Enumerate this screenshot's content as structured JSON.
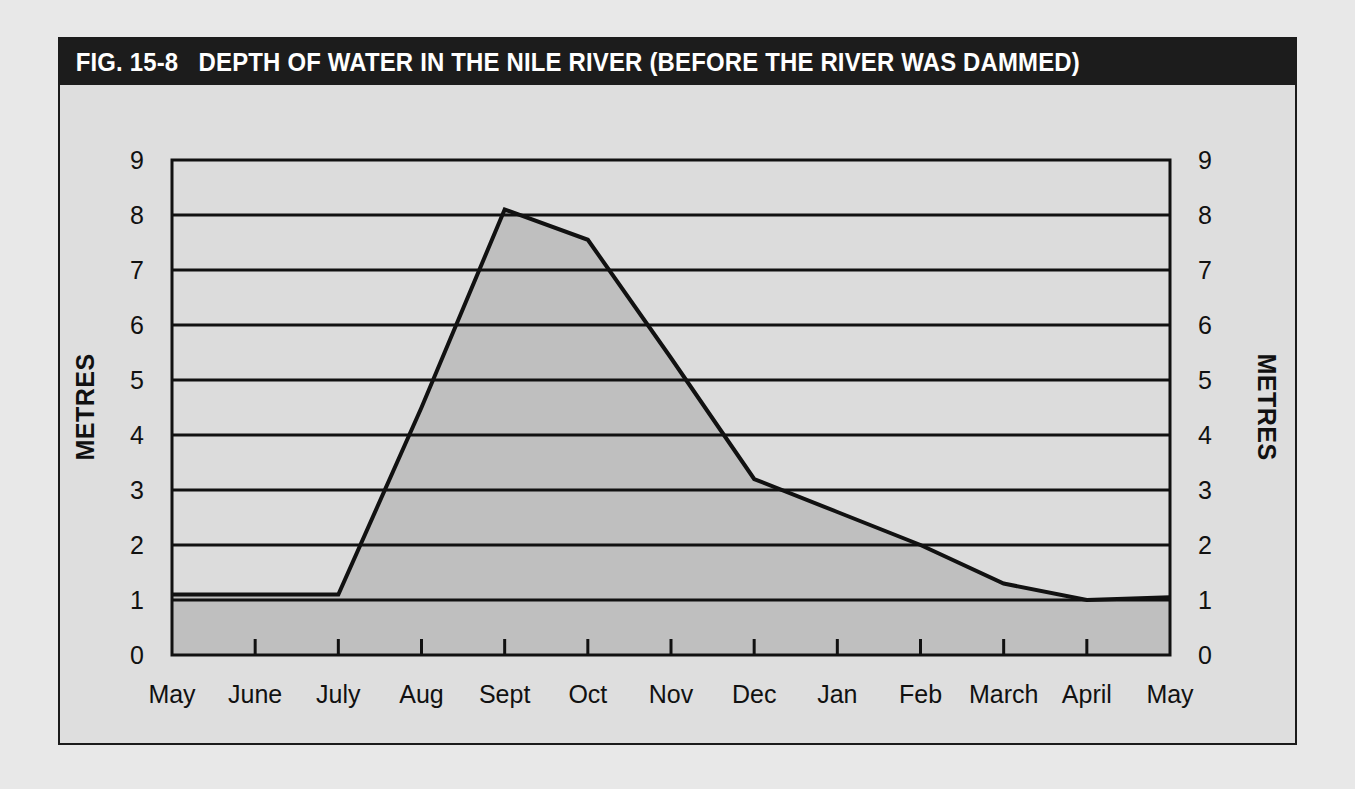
{
  "figure": {
    "number_label": "FIG. 15-8",
    "title": "DEPTH OF WATER IN THE NILE RIVER (BEFORE THE RIVER WAS DAMMED)",
    "title_bar_color": "#1c1c1c",
    "title_text_color": "#ffffff",
    "panel_color": "#dedede",
    "plot_background_color": "#dcdcdc",
    "fill_color": "#bfbfbf",
    "line_color": "#111111"
  },
  "chart_data": {
    "type": "area",
    "title": "DEPTH OF WATER IN THE NILE RIVER (BEFORE THE RIVER WAS DAMMED)",
    "categories": [
      "May",
      "June",
      "July",
      "Aug",
      "Sept",
      "Oct",
      "Nov",
      "Dec",
      "Jan",
      "Feb",
      "March",
      "April",
      "May"
    ],
    "values": [
      1.1,
      1.1,
      1.1,
      4.5,
      8.1,
      7.55,
      5.4,
      3.2,
      2.6,
      2.0,
      1.3,
      1.0,
      1.05
    ],
    "series": [
      {
        "name": "Depth of water",
        "values": [
          1.1,
          1.1,
          1.1,
          4.5,
          8.1,
          7.55,
          5.4,
          3.2,
          2.6,
          2.0,
          1.3,
          1.0,
          1.05
        ]
      }
    ],
    "xlabel": "",
    "ylabel": "METRES",
    "ylabel_right": "METRES",
    "ylim": [
      0,
      9
    ],
    "ytick_labels": [
      "0",
      "1",
      "2",
      "3",
      "4",
      "5",
      "6",
      "7",
      "8",
      "9"
    ],
    "ytick_values": [
      0,
      1,
      2,
      3,
      4,
      5,
      6,
      7,
      8,
      9
    ],
    "xtick_labels": [
      "May",
      "June",
      "July",
      "Aug",
      "Sept",
      "Oct",
      "Nov",
      "Dec",
      "Jan",
      "Feb",
      "March",
      "April",
      "May"
    ],
    "grid": true,
    "grid_axis": "y",
    "legend": null,
    "units": "metres"
  }
}
